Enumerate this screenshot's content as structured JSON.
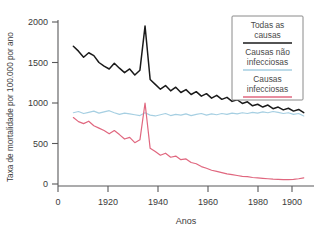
{
  "chart_data": {
    "type": "line",
    "title": "",
    "xlabel": "Anos",
    "ylabel": "Taxa de mortalidade por 100.000 por ano",
    "xlim": [
      1900,
      2000
    ],
    "ylim": [
      0,
      2000
    ],
    "xticks": [
      1900,
      1920,
      1940,
      1960,
      1980,
      2000
    ],
    "xtick_labels": [
      "0",
      "1920",
      "1940",
      "1960",
      "1980",
      "1900"
    ],
    "yticks": [
      0,
      500,
      1000,
      1500,
      2000
    ],
    "ytick_labels": [
      "0",
      "500",
      "1000",
      "1500",
      "2000"
    ],
    "grid": false,
    "legend_position": "top-right",
    "x": [
      1906,
      1908,
      1910,
      1912,
      1914,
      1916,
      1918,
      1920,
      1922,
      1924,
      1926,
      1928,
      1930,
      1932,
      1934,
      1936,
      1938,
      1940,
      1942,
      1944,
      1946,
      1948,
      1950,
      1952,
      1954,
      1956,
      1958,
      1960,
      1962,
      1964,
      1966,
      1968,
      1970,
      1972,
      1974,
      1976,
      1978,
      1980,
      1982,
      1984,
      1986,
      1988,
      1990,
      1992,
      1994,
      1996
    ],
    "series": [
      {
        "name": "Todas as causas",
        "color": "#1a1a1a",
        "values": [
          1700,
          1640,
          1565,
          1620,
          1585,
          1500,
          1455,
          1420,
          1490,
          1430,
          1375,
          1420,
          1345,
          1405,
          1950,
          1290,
          1230,
          1170,
          1215,
          1150,
          1195,
          1130,
          1165,
          1105,
          1140,
          1085,
          1115,
          1060,
          1095,
          1045,
          1070,
          1020,
          1040,
          995,
          1015,
          965,
          985,
          950,
          975,
          930,
          950,
          915,
          935,
          900,
          920,
          880
        ]
      },
      {
        "name": "Causas não infecciosas",
        "color": "#a6cfe2",
        "values": [
          880,
          895,
          870,
          885,
          900,
          875,
          890,
          905,
          880,
          860,
          875,
          865,
          855,
          845,
          880,
          850,
          840,
          855,
          870,
          845,
          860,
          850,
          865,
          845,
          860,
          870,
          850,
          865,
          855,
          870,
          860,
          875,
          865,
          880,
          870,
          885,
          875,
          890,
          880,
          895,
          885,
          870,
          880,
          860,
          870,
          840
        ]
      },
      {
        "name": "Causas infecciosas",
        "color": "#e0677f",
        "values": [
          820,
          770,
          745,
          775,
          720,
          690,
          660,
          620,
          660,
          610,
          555,
          575,
          510,
          545,
          1000,
          440,
          400,
          355,
          380,
          330,
          345,
          300,
          310,
          265,
          250,
          215,
          195,
          170,
          155,
          140,
          125,
          115,
          105,
          95,
          90,
          80,
          75,
          70,
          65,
          60,
          58,
          55,
          55,
          58,
          65,
          75
        ]
      }
    ]
  },
  "legend": {
    "entries": [
      {
        "label_line1": "Todas as",
        "label_line2": "causas",
        "color": "#1a1a1a"
      },
      {
        "label_line1": "Causas não",
        "label_line2": "infecciosas",
        "color": "#a6cfe2"
      },
      {
        "label_line1": "Causas",
        "label_line2": "infecciosas",
        "color": "#e0677f"
      }
    ]
  }
}
